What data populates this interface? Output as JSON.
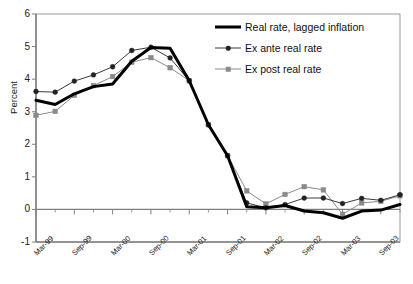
{
  "chart_data": {
    "type": "line",
    "title": "",
    "xlabel": "",
    "ylabel": "Percent",
    "ylim": [
      -1,
      6
    ],
    "yticks": [
      -1,
      0,
      1,
      2,
      3,
      4,
      5,
      6
    ],
    "grid": false,
    "legend_position": "top-right",
    "x": [
      "Mar-99",
      "Jun-99",
      "Sep-99",
      "Dec-99",
      "Mar-00",
      "Jun-00",
      "Sep-00",
      "Dec-00",
      "Mar-01",
      "Jun-01",
      "Sep-01",
      "Dec-01",
      "Mar-02",
      "Jun-02",
      "Sep-02",
      "Dec-02",
      "Mar-03",
      "Jun-03",
      "Sep-03",
      "Dec-03"
    ],
    "categories": [
      "Mar-99",
      "Jun-99",
      "Sep-99",
      "Dec-99",
      "Mar-00",
      "Jun-00",
      "Sep-00",
      "Dec-00",
      "Mar-01",
      "Jun-01",
      "Sep-01",
      "Dec-01",
      "Mar-02",
      "Jun-02",
      "Sep-02",
      "Dec-02",
      "Mar-03",
      "Jun-03",
      "Sep-03",
      "Dec-03"
    ],
    "xtick_labels": [
      "Mar-99",
      "Sep-99",
      "Mar-00",
      "Sep-00",
      "Mar-01",
      "Sep-01",
      "Mar-02",
      "Sep-02",
      "Mar-03",
      "Sep-03"
    ],
    "xtick_label_indices": [
      0,
      2,
      4,
      6,
      8,
      10,
      12,
      14,
      16,
      18
    ],
    "series": [
      {
        "name": "Real rate, lagged inflation",
        "color": "#000000",
        "marker": "none",
        "line_width": 3,
        "values": [
          3.35,
          3.22,
          3.55,
          3.77,
          3.85,
          4.55,
          4.97,
          4.95,
          3.95,
          2.6,
          1.65,
          0.08,
          0.05,
          0.12,
          -0.05,
          -0.1,
          -0.27,
          -0.05,
          -0.02,
          0.15
        ]
      },
      {
        "name": "Ex ante real rate",
        "color": "#3a3a3a",
        "marker": "diamond",
        "line_width": 1,
        "values": [
          3.62,
          3.6,
          3.94,
          4.13,
          4.38,
          4.88,
          4.98,
          4.65,
          3.95,
          2.6,
          1.65,
          0.2,
          0.05,
          0.15,
          0.35,
          0.35,
          0.18,
          0.34,
          0.28,
          0.45
        ]
      },
      {
        "name": "Ex post real rate",
        "color": "#8a8a8a",
        "marker": "square",
        "line_width": 1,
        "values": [
          2.89,
          3.01,
          3.5,
          3.8,
          4.08,
          4.52,
          4.66,
          4.35,
          3.95,
          2.6,
          1.65,
          0.57,
          0.17,
          0.46,
          0.7,
          0.6,
          -0.15,
          0.2,
          0.25,
          0.42
        ]
      }
    ]
  },
  "legend": {
    "items": [
      {
        "label": "Real rate, lagged inflation",
        "key": "thick-line"
      },
      {
        "label": "Ex ante real rate",
        "key": "line-diamond"
      },
      {
        "label": "Ex post real rate",
        "key": "line-square"
      }
    ]
  },
  "axes": {
    "y_title": "Percent",
    "y_labels": [
      "6",
      "5",
      "4",
      "3",
      "2",
      "1",
      "0",
      "-1"
    ],
    "x_labels": [
      "Mar-99",
      "Sep-99",
      "Mar-00",
      "Sep-00",
      "Mar-01",
      "Sep-01",
      "Mar-02",
      "Sep-02",
      "Mar-03",
      "Sep-03"
    ]
  },
  "colors": {
    "real_rate": "#000000",
    "ex_ante": "#3a3a3a",
    "ex_post": "#8a8a8a",
    "axis": "#808080",
    "plot_border": "#9a9a9a",
    "background": "#ffffff"
  }
}
